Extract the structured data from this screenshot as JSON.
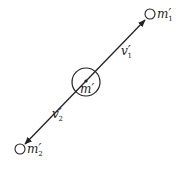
{
  "diagram": {
    "central_mass": {
      "label": "m",
      "prime": "′",
      "subscript": ""
    },
    "mass_1": {
      "label": "m",
      "prime": "′",
      "subscript": "1"
    },
    "mass_2": {
      "label": "m",
      "prime": "′",
      "subscript": "2"
    },
    "velocity_1": {
      "label": "v",
      "prime": "′",
      "subscript": "1"
    },
    "velocity_2": {
      "label": "v",
      "prime": "′",
      "subscript": "2"
    },
    "colors": {
      "stroke": "#222222",
      "background": "#ffffff"
    }
  }
}
